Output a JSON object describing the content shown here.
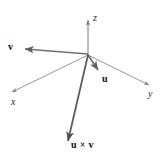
{
  "figure": {
    "name": "cross-product-vector-diagram",
    "background_color": "#ffffff",
    "axis_color": "#7a7a7a",
    "vector_color": "#6e6e6e",
    "cross_vector_color": "#585858",
    "label_color": "#1a1a1a"
  },
  "geometry": {
    "origin": {
      "x": 88,
      "y": 55
    },
    "axes": [
      {
        "id": "z",
        "label": "z",
        "tip": {
          "x": 88,
          "y": 17
        },
        "stroke_width": 1.0
      },
      {
        "id": "x",
        "label": "x",
        "tip": {
          "x": 9,
          "y": 94
        },
        "stroke_width": 1.0
      },
      {
        "id": "y",
        "label": "y",
        "tip": {
          "x": 152,
          "y": 87
        },
        "stroke_width": 1.0
      }
    ],
    "vectors": [
      {
        "id": "v",
        "label": "v",
        "tip": {
          "x": 21,
          "y": 49
        },
        "stroke_width": 1.6
      },
      {
        "id": "u",
        "label": "u",
        "tip": {
          "x": 101,
          "y": 73
        },
        "stroke_width": 1.6
      },
      {
        "id": "uxv",
        "label": "u × v",
        "tip": {
          "x": 67,
          "y": 145
        },
        "stroke_width": 1.8
      }
    ]
  },
  "labels": {
    "axis_z": "z",
    "axis_x": "x",
    "axis_y": "y",
    "vector_v": "v",
    "vector_u": "u",
    "vector_cross": "u × v"
  }
}
